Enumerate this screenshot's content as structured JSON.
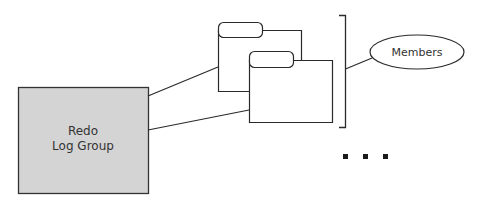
{
  "diagram": {
    "redo_log_group": {
      "line1": "Redo",
      "line2": "Log Group",
      "fill": "#d4d4d4",
      "stroke": "#333333"
    },
    "members_label": "Members",
    "member_files": [
      {
        "name": "member-file-1"
      },
      {
        "name": "member-file-2"
      }
    ],
    "ellipsis": "...",
    "colors": {
      "stroke": "#2a2a2a",
      "box_fill": "#d4d4d4",
      "background": "#ffffff"
    }
  }
}
